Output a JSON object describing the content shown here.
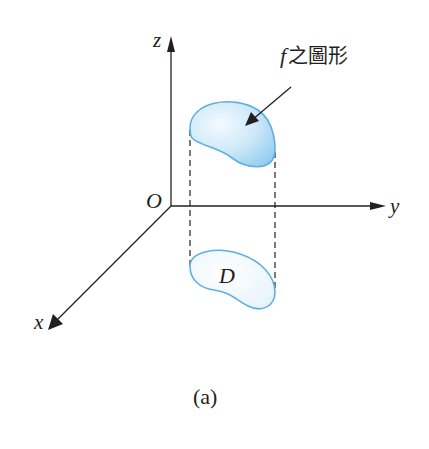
{
  "diagram": {
    "axes": {
      "z_label": "z",
      "y_label": "y",
      "x_label": "x",
      "origin_label": "O"
    },
    "surface_label": {
      "f": "f",
      "text": "之圖形"
    },
    "region_label": "D",
    "caption": "(a)",
    "colors": {
      "axis": "#231f20",
      "region_stroke": "#5fb0e0",
      "region_fill_light": "#eaf5fc",
      "region_fill_dark": "#a9d8f2",
      "text": "#231f20"
    }
  }
}
